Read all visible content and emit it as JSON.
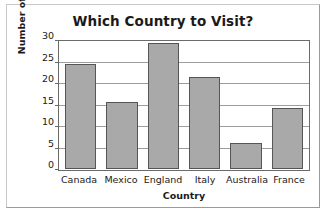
{
  "chart_data": {
    "type": "bar",
    "title": "Which Country to Visit?",
    "xlabel": "Country",
    "ylabel": "Number of People",
    "categories": [
      "Canada",
      "Mexico",
      "England",
      "Italy",
      "Australia",
      "France"
    ],
    "values": [
      24.5,
      15.7,
      29.3,
      21.5,
      6.0,
      14.3
    ],
    "ylim": [
      0,
      30
    ],
    "ytick_labels": [
      "0",
      "5",
      "10",
      "15",
      "20",
      "25",
      "30"
    ],
    "ytick_values": [
      0,
      5,
      10,
      15,
      20,
      25,
      30
    ],
    "grid": "horizontal",
    "legend": "none",
    "bar_color": "#a9a9a9",
    "bar_border_color": "#555555",
    "axis_color": "#6a6a6a",
    "grid_color": "#9d9d9d",
    "background": "#ffffff"
  }
}
